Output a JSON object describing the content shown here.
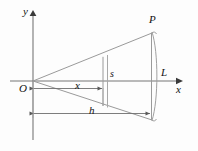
{
  "figure": {
    "background_color": "#fdfdfd",
    "line_color": "#8a8a8a",
    "axis_color": "#6b6b6b",
    "text_color": "#111111",
    "axes": {
      "x_axis_label": "x",
      "y_axis_label": "y",
      "origin_label": "O"
    },
    "labels": {
      "point_p": "P",
      "line_l": "L",
      "segment_s": "s",
      "dimension_x": "x",
      "dimension_h": "h"
    },
    "geometry": {
      "origin": [
        33,
        81
      ],
      "apex_point_p": [
        152,
        33
      ],
      "lower_vertex": [
        152,
        120
      ],
      "vertical_s_line_x": 103,
      "vertical_s_line_top": 57,
      "vertical_s_line_bottom": 106,
      "second_vertical_x": 108,
      "right_arc_x": 157,
      "x_dimension_y": 88,
      "x_dimension_from": 33,
      "x_dimension_to": 103,
      "h_dimension_y": 113,
      "h_dimension_from": 33,
      "h_dimension_to": 151,
      "x_axis_arrow_tip": [
        181,
        81
      ],
      "y_axis_arrow_tip": [
        33,
        11
      ],
      "y_axis_bottom": 140
    }
  }
}
